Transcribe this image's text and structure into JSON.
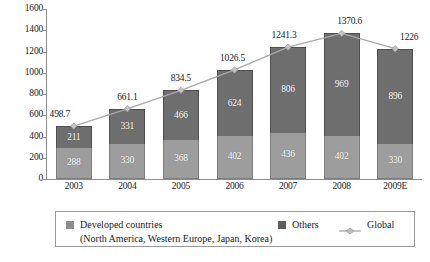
{
  "chart_data": {
    "type": "bar",
    "subtype": "stacked-bar-with-line",
    "title": "",
    "subtitle": "",
    "xlabel": "",
    "ylabel": "",
    "ylim": [
      0,
      1600
    ],
    "ytick_step": 200,
    "yticks": [
      0,
      200,
      400,
      600,
      800,
      1000,
      1200,
      1400,
      1600
    ],
    "ytick_labels": [
      "0",
      "200",
      "400",
      "600",
      "800",
      "1000",
      "1200",
      "1400",
      "1600"
    ],
    "grid": false,
    "legend_position": "bottom",
    "categories": [
      "2003",
      "2004",
      "2005",
      "2006",
      "2007",
      "2008",
      "2009E"
    ],
    "series": [
      {
        "name": "Developed countries",
        "kind": "bar-segment",
        "stack_position": "bottom",
        "color": "#9d9d9d",
        "values": [
          288,
          330,
          368,
          402,
          436,
          402,
          330
        ],
        "labels": [
          "288",
          "330",
          "368",
          "402",
          "436",
          "402",
          "330"
        ]
      },
      {
        "name": "Others",
        "kind": "bar-segment",
        "stack_position": "top",
        "color": "#6e6e6e",
        "values": [
          211,
          331,
          466,
          624,
          806,
          969,
          896
        ],
        "labels": [
          "211",
          "331",
          "466",
          "624",
          "806",
          "969",
          "896"
        ]
      },
      {
        "name": "Global",
        "kind": "line",
        "color": "#a8a8a8",
        "values": [
          498.7,
          661.1,
          834.5,
          1026.5,
          1241.3,
          1370.6,
          1226
        ],
        "labels": [
          "498.7",
          "661.1",
          "834.5",
          "1026.5",
          "1241.3",
          "1370.6",
          "1226"
        ]
      }
    ]
  },
  "axes": {
    "y_tick_labels": [
      "1600",
      "1400",
      "1200",
      "1000",
      "800",
      "600",
      "400",
      "200",
      "0"
    ],
    "x_tick_labels": [
      "2003",
      "2004",
      "2005",
      "2006",
      "2007",
      "2008",
      "2009E"
    ]
  },
  "legend": {
    "developed_label": "Developed countries",
    "developed_sublabel": "(North America, Western Europe, Japan, Korea)",
    "others_label": "Others",
    "global_label": "Global"
  },
  "colors": {
    "developed": "#9d9d9d",
    "others": "#6e6e6e",
    "global_line": "#a8a8a8",
    "axis": "#8c8c8c",
    "text": "#1a1a1a"
  }
}
